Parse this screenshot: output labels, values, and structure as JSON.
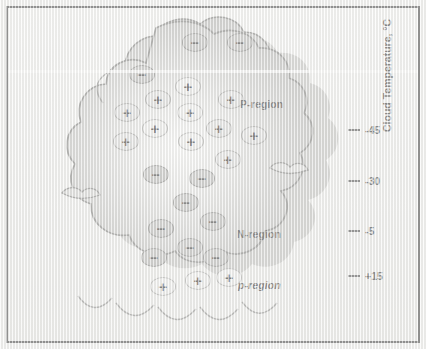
{
  "figure": {
    "background_color": "#f2f2f0",
    "frame_color": "#2b2b2b"
  },
  "cloud": {
    "fill_light": "#d8d8d6",
    "fill_mid": "#bdbdbb",
    "fill_dark": "#a5a5a3",
    "outline": "#6f6f6d",
    "shadow": "#8f8f8d"
  },
  "regions": [
    {
      "id": "p-region-upper",
      "label": "P-region",
      "style": "normal",
      "polarity": "positive",
      "x": 240,
      "y": 98
    },
    {
      "id": "n-region",
      "label": "N-region",
      "style": "normal",
      "polarity": "negative",
      "x": 237,
      "y": 228
    },
    {
      "id": "p-region-lower",
      "label": "p-region",
      "style": "italic",
      "polarity": "positive",
      "x": 238,
      "y": 279
    }
  ],
  "axis": {
    "title": "Cloud Temperature, °C",
    "unit": "°C",
    "ticks": [
      {
        "label": "-45",
        "value": -45,
        "y": 124
      },
      {
        "label": "-30",
        "value": -30,
        "y": 175
      },
      {
        "label": "-5",
        "value": -5,
        "y": 225
      },
      {
        "label": "+15",
        "value": 15,
        "y": 270
      }
    ]
  },
  "charges": {
    "negative_symbol": "−",
    "positive_symbol": "+",
    "screening_top": [
      {
        "x": 182,
        "y": 33
      },
      {
        "x": 227,
        "y": 33
      },
      {
        "x": 129,
        "y": 65
      }
    ],
    "p_region": [
      {
        "x": 175,
        "y": 77,
        "bright": true
      },
      {
        "x": 145,
        "y": 90,
        "bright": false
      },
      {
        "x": 218,
        "y": 90,
        "bright": false
      },
      {
        "x": 114,
        "y": 103,
        "bright": false
      },
      {
        "x": 177,
        "y": 103,
        "bright": true
      },
      {
        "x": 142,
        "y": 119,
        "bright": true
      },
      {
        "x": 206,
        "y": 119,
        "bright": false
      },
      {
        "x": 241,
        "y": 126,
        "bright": false
      },
      {
        "x": 113,
        "y": 132,
        "bright": false
      },
      {
        "x": 178,
        "y": 132,
        "bright": true
      },
      {
        "x": 215,
        "y": 150,
        "bright": false
      }
    ],
    "n_region": [
      {
        "x": 143,
        "y": 165
      },
      {
        "x": 189,
        "y": 169
      },
      {
        "x": 173,
        "y": 193
      },
      {
        "x": 200,
        "y": 212
      },
      {
        "x": 148,
        "y": 219
      },
      {
        "x": 177,
        "y": 238
      },
      {
        "x": 141,
        "y": 248
      },
      {
        "x": 203,
        "y": 248
      }
    ],
    "p_region_lower": [
      {
        "x": 150,
        "y": 277
      },
      {
        "x": 185,
        "y": 271
      },
      {
        "x": 216,
        "y": 268
      }
    ]
  }
}
